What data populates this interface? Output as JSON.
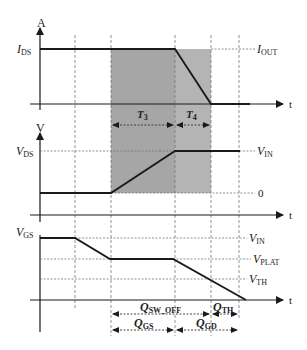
{
  "diagram": {
    "colors": {
      "shade": "#a8a8a8",
      "line": "#1a1a1a",
      "guide": "#777777"
    },
    "panel_current": {
      "axis_label": "A",
      "time_label": "t",
      "y_label_main": "I",
      "y_label_sub": "DS",
      "right_label_main": "I",
      "right_label_sub": "OUT"
    },
    "panel_voltage": {
      "axis_label": "V",
      "time_label": "t",
      "y_label_main": "V",
      "y_label_sub": "DS",
      "right_top_main": "V",
      "right_top_sub": "IN",
      "right_bottom": "0",
      "interval_t3_main": "T",
      "interval_t3_sub": "3",
      "interval_t4_main": "T",
      "interval_t4_sub": "4"
    },
    "panel_gate": {
      "time_label": "t",
      "y_label_main": "V",
      "y_label_sub": "GS",
      "level_in_main": "V",
      "level_in_sub": "IN",
      "level_plat_main": "V",
      "level_plat_sub": "PLAT",
      "level_th_main": "V",
      "level_th_sub": "TH"
    },
    "charges": {
      "q_sw_off_main": "Q",
      "q_sw_off_sub": "SW_OFF",
      "q_th_main": "Q",
      "q_th_sub": "TH",
      "q_gs_main": "Q",
      "q_gs_sub": "GS",
      "q_gd_main": "Q",
      "q_gd_sub": "GD"
    }
  }
}
